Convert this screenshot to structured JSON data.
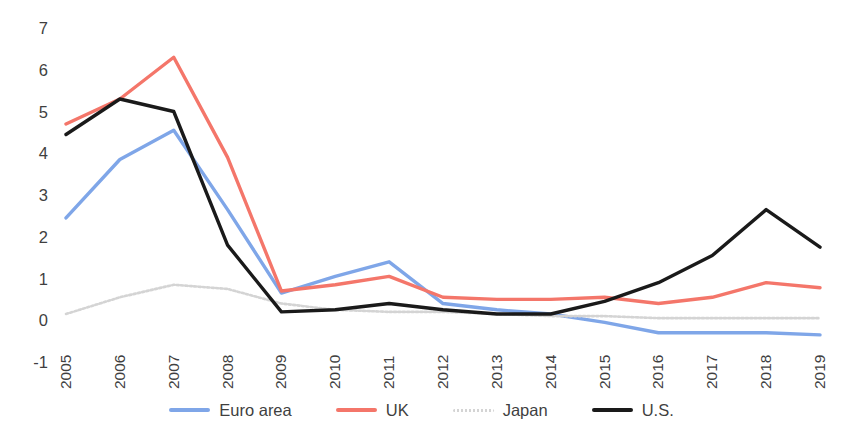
{
  "chart_data": {
    "type": "line",
    "title": "",
    "xlabel": "",
    "ylabel": "",
    "categories": [
      "2005",
      "2006",
      "2007",
      "2008",
      "2009",
      "2010",
      "2011",
      "2012",
      "2013",
      "2014",
      "2015",
      "2016",
      "2017",
      "2018",
      "2019"
    ],
    "x": [
      2005,
      2006,
      2007,
      2008,
      2009,
      2010,
      2011,
      2012,
      2013,
      2014,
      2015,
      2016,
      2017,
      2018,
      2019
    ],
    "ylim": [
      -1,
      7
    ],
    "yticks": [
      7,
      6,
      5,
      4,
      3,
      2,
      1,
      0,
      -1
    ],
    "ytick_labels": [
      "7",
      "6",
      "5",
      "4",
      "3",
      "2",
      "1",
      "0",
      "-1"
    ],
    "grid": false,
    "legend_position": "bottom",
    "series": [
      {
        "name": "Euro area",
        "color": "#7FA6E8",
        "style": "solid",
        "values": [
          2.45,
          3.85,
          4.55,
          2.65,
          0.65,
          1.05,
          1.4,
          0.4,
          0.25,
          0.15,
          -0.05,
          -0.3,
          -0.3,
          -0.3,
          -0.35
        ]
      },
      {
        "name": "UK",
        "color": "#F4766A",
        "style": "solid",
        "values": [
          4.7,
          5.3,
          6.3,
          3.9,
          0.7,
          0.85,
          1.05,
          0.55,
          0.5,
          0.5,
          0.55,
          0.4,
          0.55,
          0.9,
          0.78
        ]
      },
      {
        "name": "Japan",
        "color": "#D4D4D4",
        "style": "dotted",
        "values": [
          0.15,
          0.55,
          0.85,
          0.75,
          0.4,
          0.25,
          0.2,
          0.2,
          0.15,
          0.1,
          0.1,
          0.05,
          0.05,
          0.05,
          0.05
        ]
      },
      {
        "name": "U.S.",
        "color": "#1A1A1A",
        "style": "solid",
        "values": [
          4.45,
          5.3,
          5.0,
          1.8,
          0.2,
          0.25,
          0.4,
          0.25,
          0.15,
          0.15,
          0.45,
          0.9,
          1.55,
          2.65,
          1.75
        ]
      }
    ]
  },
  "legend": {
    "items": [
      {
        "label": "Euro area",
        "color": "#7FA6E8",
        "style": "solid"
      },
      {
        "label": "UK",
        "color": "#F4766A",
        "style": "solid"
      },
      {
        "label": "Japan",
        "color": "#D4D4D4",
        "style": "dotted"
      },
      {
        "label": "U.S.",
        "color": "#1A1A1A",
        "style": "solid"
      }
    ]
  }
}
